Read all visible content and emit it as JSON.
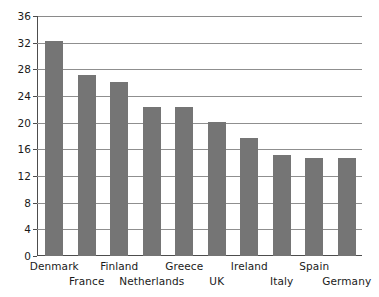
{
  "chart_data": {
    "type": "bar",
    "title": "",
    "subtitle": "",
    "xlabel": "",
    "ylabel": "",
    "categories": [
      "Denmark",
      "France",
      "Finland",
      "Netherlands",
      "Greece",
      "UK",
      "Ireland",
      "Italy",
      "Spain",
      "Germany"
    ],
    "values": [
      32.2,
      27.1,
      26.1,
      22.4,
      22.4,
      20.1,
      17.7,
      15.2,
      14.7,
      14.7
    ],
    "ylim": [
      0,
      36
    ],
    "yticks": [
      0,
      4,
      8,
      12,
      16,
      20,
      24,
      28,
      32,
      36
    ],
    "ytick_labels": [
      "0",
      "4",
      "8",
      "12",
      "16",
      "20",
      "24",
      "28",
      "32",
      "36"
    ],
    "grid": true,
    "grid_axis": "y",
    "legend": false,
    "legend_position": "none",
    "bar_color": "#757575",
    "gridline_color": "#8f8f8f",
    "axis_color": "#4d4d4d",
    "background_color": "#ffffff",
    "label_color": "#1a1a1a",
    "xlabel_rows": [
      0,
      1,
      0,
      1,
      0,
      1,
      0,
      1,
      0,
      1
    ]
  }
}
